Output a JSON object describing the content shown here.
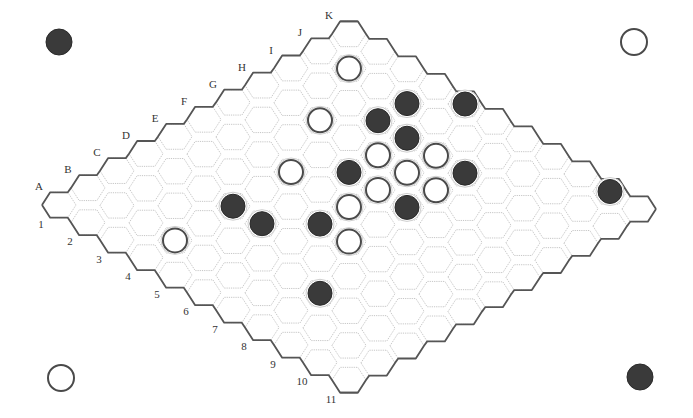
{
  "game": "Hex",
  "board": {
    "size": 11,
    "column_labels": [
      "A",
      "B",
      "C",
      "D",
      "E",
      "F",
      "G",
      "H",
      "I",
      "J",
      "K"
    ],
    "row_labels": [
      "1",
      "2",
      "3",
      "4",
      "5",
      "6",
      "7",
      "8",
      "9",
      "10",
      "11"
    ],
    "origin": {
      "x": 59,
      "y": 205
    },
    "col_step": {
      "dx": 29,
      "dy": -17.1
    },
    "row_step": {
      "dx": 29,
      "dy": 17.5
    },
    "hex_radius": 17,
    "stone_radius": 12
  },
  "stones": [
    {
      "cell": "J2",
      "color": "white"
    },
    {
      "cell": "J4",
      "color": "black"
    },
    {
      "cell": "K5",
      "color": "black"
    },
    {
      "cell": "H3",
      "color": "white"
    },
    {
      "cell": "I4",
      "color": "black"
    },
    {
      "cell": "I5",
      "color": "black"
    },
    {
      "cell": "H5",
      "color": "white"
    },
    {
      "cell": "I6",
      "color": "white"
    },
    {
      "cell": "F4",
      "color": "white"
    },
    {
      "cell": "G5",
      "color": "black"
    },
    {
      "cell": "H6",
      "color": "white"
    },
    {
      "cell": "I7",
      "color": "black"
    },
    {
      "cell": "G6",
      "color": "white"
    },
    {
      "cell": "H7",
      "color": "white"
    },
    {
      "cell": "K10",
      "color": "black"
    },
    {
      "cell": "D4",
      "color": "black"
    },
    {
      "cell": "F6",
      "color": "white"
    },
    {
      "cell": "G7",
      "color": "black"
    },
    {
      "cell": "D5",
      "color": "black"
    },
    {
      "cell": "E6",
      "color": "black"
    },
    {
      "cell": "B4",
      "color": "white"
    },
    {
      "cell": "E7",
      "color": "white"
    },
    {
      "cell": "C8",
      "color": "black"
    }
  ],
  "corner_markers": [
    {
      "position": "top-left",
      "color": "black",
      "x": 59,
      "y": 42
    },
    {
      "position": "top-right",
      "color": "white",
      "x": 634,
      "y": 42
    },
    {
      "position": "bottom-left",
      "color": "white",
      "x": 61,
      "y": 378
    },
    {
      "position": "bottom-right",
      "color": "black",
      "x": 640,
      "y": 377
    }
  ],
  "colors": {
    "black_stone": "#3a3a3a",
    "white_stone": "#ffffff",
    "edge_line": "#555555",
    "grid_line": "#b8b8b8"
  }
}
